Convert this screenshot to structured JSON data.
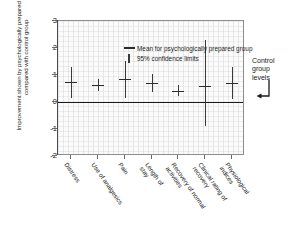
{
  "chart_data": {
    "type": "scatter",
    "title": "",
    "subtitle": "",
    "xlabel": "",
    "ylabel": "Improvement shown by psychologically prepared group compared with control group",
    "ylim": [
      -2,
      3
    ],
    "yticks": [
      3,
      2,
      1,
      0,
      -1,
      -2
    ],
    "ytick_labels": [
      "3",
      "2",
      "1",
      "0",
      "-1",
      "-2"
    ],
    "grid": true,
    "legend_position": "top-left",
    "legend": [
      {
        "key": "dash",
        "label": "Mean for psychologically prepared group"
      },
      {
        "key": "bar",
        "label": "95% confidence limits"
      }
    ],
    "categories": [
      "Distress",
      "Use of analgesics",
      "Pain",
      "Length of stay",
      "Recovery of normal activities",
      "Clinical rating of recovery",
      "Physiological indices"
    ],
    "category_lines": [
      [
        "Distress"
      ],
      [
        "Use of analgesics"
      ],
      [
        "Pain"
      ],
      [
        "Length of",
        "stay"
      ],
      [
        "Recovery of normal",
        "activities"
      ],
      [
        "Clinical rating of",
        "recovery"
      ],
      [
        "Physiological",
        "indices"
      ]
    ],
    "series": [
      {
        "name": "Mean for psychologically prepared group",
        "values": [
          0.75,
          0.62,
          0.85,
          0.72,
          0.4,
          0.6,
          0.7
        ]
      },
      {
        "name": "95% confidence limits lower",
        "values": [
          0.15,
          0.42,
          0.15,
          0.38,
          0.22,
          -0.9,
          0.1
        ]
      },
      {
        "name": "95% confidence limits upper",
        "values": [
          1.3,
          0.85,
          1.52,
          1.05,
          0.62,
          2.28,
          1.3
        ]
      }
    ],
    "reference_line": {
      "value": 0,
      "label": "Control group levels"
    },
    "annotation": {
      "lines": [
        "Control",
        "group",
        "levels"
      ]
    },
    "colors": {
      "mean": "#2b2b2b",
      "whisker": "#3a3a3a",
      "axis": "#4a4a4a",
      "zero_line": "#1b1b1b",
      "plot_background": "#fbfbfb",
      "page_background": "#ffffff"
    }
  }
}
